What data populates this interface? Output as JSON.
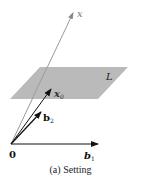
{
  "figure": {
    "caption": "(a) Setting",
    "colors": {
      "plane_fill": "#b3b3b3",
      "vector_x": "#888888",
      "vector_dark": "#111111",
      "text": "#222222"
    },
    "labels": {
      "x": "x",
      "x0_base": "x",
      "x0_sub": "0",
      "plane": "L",
      "b2_base": "b",
      "b2_sub": "2",
      "b1_base": "b",
      "b1_sub": "1",
      "origin": "0"
    }
  }
}
